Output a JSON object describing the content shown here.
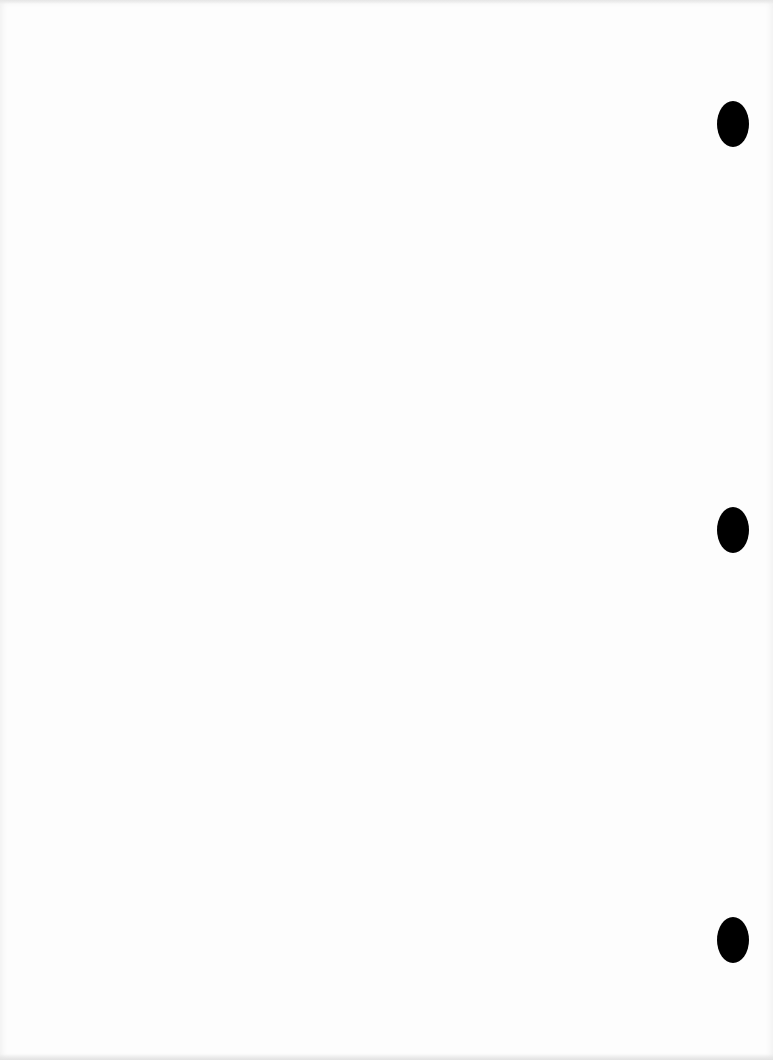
{
  "document": {
    "type": "blank-punched-sheet",
    "background_color": "#fdfdfd",
    "hole_color": "#000000",
    "punch_holes": [
      {
        "cx": 733,
        "cy": 124
      },
      {
        "cx": 733,
        "cy": 530
      },
      {
        "cx": 733,
        "cy": 940
      }
    ]
  }
}
